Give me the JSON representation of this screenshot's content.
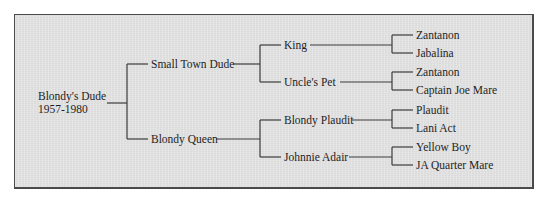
{
  "pedigree": {
    "root": {
      "name": "Blondy's Dude",
      "years": "1957-1980"
    },
    "sire": {
      "name": "Small Town Dude",
      "sire": {
        "name": "King",
        "sire": {
          "name": "Zantanon"
        },
        "dam": {
          "name": "Jabalina"
        }
      },
      "dam": {
        "name": "Uncle's Pet",
        "sire": {
          "name": "Zantanon"
        },
        "dam": {
          "name": "Captain Joe Mare"
        }
      }
    },
    "dam": {
      "name": "Blondy Queen",
      "sire": {
        "name": "Blondy Plaudit",
        "sire": {
          "name": "Plaudit"
        },
        "dam": {
          "name": "Lani Act"
        }
      },
      "dam": {
        "name": "Johnnie Adair",
        "sire": {
          "name": "Yellow Boy"
        },
        "dam": {
          "name": "JA Quarter Mare"
        }
      }
    }
  },
  "colors": {
    "panel_background": "#e3e3e3",
    "border": "#4a4a4a",
    "line": "#3c3c3c",
    "text": "#1e1e1e"
  }
}
